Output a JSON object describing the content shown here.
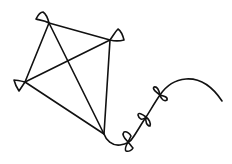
{
  "image": {
    "subject": "kite line drawing",
    "background_color": "#ffffff",
    "stroke_color": "#111111",
    "kite": {
      "vertices": {
        "top": [
          49,
          23
        ],
        "right": [
          110,
          40
        ],
        "left": [
          25,
          82
        ],
        "bottom": [
          104,
          134
        ]
      }
    },
    "tail": {
      "bow_count": 3,
      "bows": [
        {
          "x": 128,
          "y": 142
        },
        {
          "x": 146,
          "y": 117
        },
        {
          "x": 160,
          "y": 95
        }
      ],
      "end": [
        222,
        101
      ]
    }
  }
}
